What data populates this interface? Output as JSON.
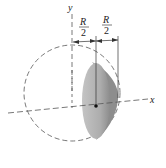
{
  "figure": {
    "type": "spherical-segment-diagram",
    "axes": {
      "y_label": "y",
      "x_label": "x"
    },
    "dimensions": [
      {
        "numerator": "R",
        "denominator": "2"
      },
      {
        "numerator": "R",
        "denominator": "2"
      }
    ],
    "colors": {
      "line": "#333333",
      "shade_light": "#b8b8b8",
      "shade_dark": "#8a8a8a",
      "dashed": "#555555"
    }
  }
}
